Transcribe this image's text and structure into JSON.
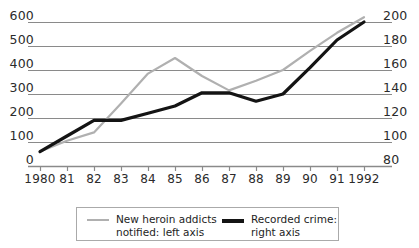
{
  "chart_data": {
    "type": "line",
    "title": "",
    "xlabel": "",
    "ylabel": "",
    "grid": true,
    "legend_position": "bottom",
    "x": [
      "1980",
      "81",
      "82",
      "83",
      "84",
      "85",
      "86",
      "87",
      "88",
      "89",
      "90",
      "91",
      "1992"
    ],
    "categories": [
      "1980",
      "81",
      "82",
      "83",
      "84",
      "85",
      "86",
      "87",
      "88",
      "89",
      "90",
      "91",
      "1992"
    ],
    "axes": {
      "left": {
        "label": "New heroin addicts notified",
        "ticks": [
          0,
          100,
          200,
          300,
          400,
          500,
          600
        ],
        "ylim": [
          0,
          600
        ],
        "tick_labels": [
          "0",
          "100",
          "200",
          "300",
          "400",
          "500",
          "600"
        ]
      },
      "right": {
        "label": "Recorded crime",
        "ticks": [
          80,
          100,
          120,
          140,
          160,
          180,
          200
        ],
        "ylim": [
          80,
          200
        ],
        "tick_labels": [
          "80",
          "100",
          "120",
          "140",
          "160",
          "180",
          "200"
        ]
      }
    },
    "series": [
      {
        "name": "New heroin addicts notified: left axis",
        "axis": "left",
        "color": "#b0b0b0",
        "values": [
          60,
          105,
          140,
          260,
          385,
          450,
          375,
          315,
          355,
          400,
          480,
          555,
          620
        ]
      },
      {
        "name": "Recorded crime: right axis",
        "axis": "right",
        "color": "#141414",
        "values": [
          92,
          105,
          118,
          118,
          124,
          130,
          141,
          141,
          134,
          140,
          162,
          185,
          200
        ]
      }
    ]
  },
  "legend": {
    "entries": [
      {
        "label": "New heroin addicts\nnotified: left axis",
        "swatch": "gray-line-swatch"
      },
      {
        "label": "Recorded crime:\nright axis",
        "swatch": "black-line-swatch"
      }
    ]
  }
}
